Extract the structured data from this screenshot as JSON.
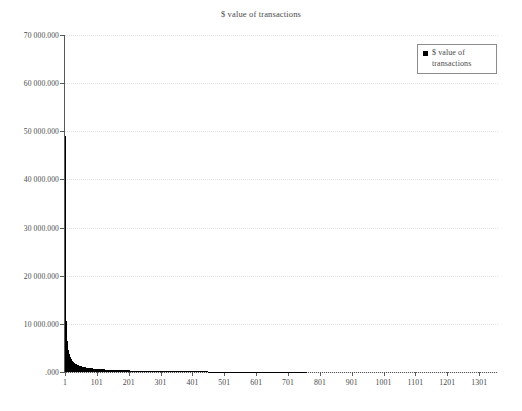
{
  "chart_data": {
    "type": "bar",
    "title": "$ value of transactions",
    "xlabel": "",
    "ylabel": "",
    "grid": true,
    "legend_position": "top-right",
    "legend": [
      "$ value of transactions"
    ],
    "ylim": [
      0,
      70000000
    ],
    "ytick_labels": [
      "70 000.000",
      "60 000.000",
      "50 000.000",
      "40 000.000",
      "30 000.000",
      "20 000.000",
      "10 000.000",
      ".000"
    ],
    "ytick_values": [
      70000000,
      60000000,
      50000000,
      40000000,
      30000000,
      20000000,
      10000000,
      0
    ],
    "xlim": [
      1,
      1360
    ],
    "xtick_labels": [
      "1",
      "101",
      "201",
      "301",
      "401",
      "501",
      "601",
      "701",
      "801",
      "901",
      "1001",
      "1101",
      "1201",
      "1301"
    ],
    "xtick_values": [
      1,
      101,
      201,
      301,
      401,
      501,
      601,
      701,
      801,
      901,
      1001,
      1101,
      1201,
      1301
    ],
    "series_name": "$ value of transactions",
    "series_color": "#000000",
    "x": [
      1,
      2,
      3,
      4,
      5,
      6,
      7,
      8,
      9,
      10,
      12,
      14,
      16,
      18,
      20,
      23,
      26,
      29,
      32,
      36,
      40,
      45,
      50,
      56,
      62,
      70,
      78,
      87,
      97,
      108,
      120,
      134,
      149,
      166,
      185,
      206,
      229,
      255,
      284,
      316,
      352,
      392,
      436,
      485,
      540,
      601,
      669,
      745,
      829,
      923,
      1027,
      1143,
      1272,
      1340
    ],
    "values": [
      49000000,
      21000000,
      14500000,
      11000000,
      9000000,
      7600000,
      6600000,
      5900000,
      5300000,
      4800000,
      4100000,
      3600000,
      3200000,
      2900000,
      2650000,
      2350000,
      2100000,
      1920000,
      1770000,
      1600000,
      1460000,
      1320000,
      1200000,
      1090000,
      1000000,
      900000,
      815000,
      740000,
      670000,
      605000,
      545000,
      490000,
      440000,
      395000,
      350000,
      310000,
      275000,
      240000,
      210000,
      180000,
      155000,
      132000,
      112000,
      94000,
      78000,
      63000,
      50000,
      39000,
      29000,
      21000,
      14000,
      8500,
      4000,
      1000
    ],
    "annotation": "Power-law / long-tail distribution: the largest transaction value is near 49 000.000 and values decay steeply toward .000 past index ~250."
  },
  "legend": {
    "marker": "filled-square",
    "label": "$ value of transactions"
  }
}
